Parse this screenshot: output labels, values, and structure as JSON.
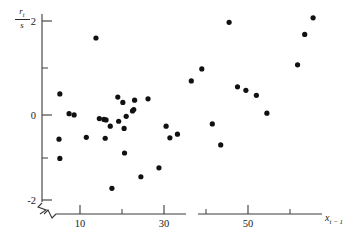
{
  "figure": {
    "caption_fragment": "",
    "background_color": "#ffffff",
    "point_color": "#111111",
    "axis_color": "#3a3a3a"
  },
  "axes": {
    "y_label_numerator": "r",
    "y_label_numerator_sub": "t",
    "y_label_denominator": "s",
    "x_label_main": "x",
    "x_label_sub": "t − 1",
    "y_ticklabels": [
      "2",
      "0",
      "-2"
    ],
    "x_ticklabels": [
      "10",
      "30",
      "50"
    ],
    "y_minor_ticks": [
      1,
      -1
    ],
    "x_minor_ticks": [
      20,
      40,
      60
    ],
    "y_axis_break": true,
    "x_axis_break": true
  },
  "chart_data": {
    "type": "scatter",
    "title": "",
    "xlabel": "x_{t-1}",
    "ylabel": "r_t / s",
    "xlim": [
      3,
      68
    ],
    "ylim": [
      -2.35,
      2.35
    ],
    "grid": false,
    "legend": "none",
    "xticks": [
      10,
      30,
      50
    ],
    "xticks_minor": [
      20,
      40,
      60
    ],
    "yticks": [
      2,
      0,
      -2
    ],
    "yticks_minor": [
      1,
      -1
    ],
    "n_points": 40,
    "series": [
      {
        "name": "standardized residual vs lagged x",
        "points": [
          [
            5.2,
            0.37
          ],
          [
            5.0,
            -0.64
          ],
          [
            5.2,
            -1.07
          ],
          [
            7.4,
            -0.07
          ],
          [
            8.6,
            -0.1
          ],
          [
            11.5,
            -0.6
          ],
          [
            13.8,
            1.62
          ],
          [
            14.6,
            -0.18
          ],
          [
            15.7,
            -0.2
          ],
          [
            16.2,
            -0.21
          ],
          [
            16.0,
            -0.62
          ],
          [
            17.2,
            -0.35
          ],
          [
            17.6,
            -1.74
          ],
          [
            19.2,
            -0.24
          ],
          [
            19.0,
            0.3
          ],
          [
            20.2,
            0.18
          ],
          [
            20.6,
            -0.95
          ],
          [
            20.5,
            -0.4
          ],
          [
            21.0,
            -0.13
          ],
          [
            22.5,
            -0.01
          ],
          [
            22.8,
            0.02
          ],
          [
            23.0,
            0.23
          ],
          [
            24.5,
            -1.48
          ],
          [
            26.2,
            0.26
          ],
          [
            28.8,
            -1.28
          ],
          [
            30.5,
            -0.35
          ],
          [
            31.4,
            -0.61
          ],
          [
            33.2,
            -0.53
          ],
          [
            36.5,
            0.66
          ],
          [
            39.0,
            0.93
          ],
          [
            41.5,
            -0.3
          ],
          [
            43.5,
            -0.77
          ],
          [
            45.5,
            1.97
          ],
          [
            47.5,
            0.53
          ],
          [
            49.5,
            0.45
          ],
          [
            52.0,
            0.34
          ],
          [
            54.5,
            -0.06
          ],
          [
            61.8,
            1.02
          ],
          [
            63.5,
            1.7
          ],
          [
            65.5,
            2.07
          ]
        ]
      }
    ]
  }
}
